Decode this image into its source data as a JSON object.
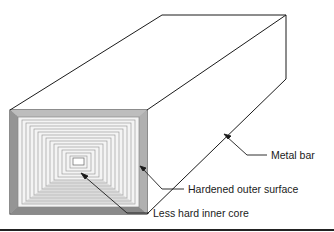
{
  "diagram": {
    "labels": {
      "metal_bar": "Metal bar",
      "outer_surface": "Hardened outer surface",
      "inner_core": "Less hard inner core"
    },
    "colors": {
      "line": "#1a1a1a",
      "hardened_shell": "#9a9a9a",
      "core_pattern": "#b5b5b5",
      "background": "#ffffff"
    }
  }
}
